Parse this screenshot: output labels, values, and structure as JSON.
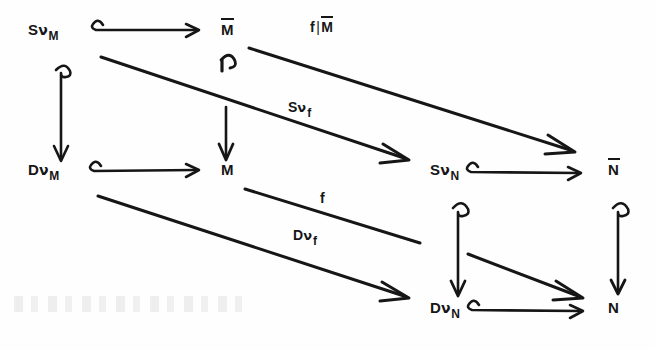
{
  "figure": {
    "kind": "commutative-diagram",
    "background_color": "#fefefe",
    "ink_color": "#161616"
  },
  "nodes": [
    {
      "id": "SvM",
      "text": "SνM",
      "base": "S",
      "nu": "ν",
      "sub": "M",
      "overbar": false,
      "x": 28,
      "y": 22
    },
    {
      "id": "Mbar",
      "text": "M̄",
      "base": "M",
      "nu": "",
      "sub": "",
      "overbar": true,
      "x": 221,
      "y": 22
    },
    {
      "id": "DvM",
      "text": "DνM",
      "base": "D",
      "nu": "ν",
      "sub": "M",
      "overbar": false,
      "x": 28,
      "y": 162
    },
    {
      "id": "M",
      "text": "M",
      "base": "M",
      "nu": "",
      "sub": "",
      "overbar": false,
      "x": 221,
      "y": 162
    },
    {
      "id": "SvN",
      "text": "SνN",
      "base": "S",
      "nu": "ν",
      "sub": "N",
      "overbar": false,
      "x": 430,
      "y": 162
    },
    {
      "id": "Nbar",
      "text": "N̄",
      "base": "N",
      "nu": "",
      "sub": "",
      "overbar": true,
      "x": 608,
      "y": 162
    },
    {
      "id": "DvN",
      "text": "DνN",
      "base": "D",
      "nu": "ν",
      "sub": "N",
      "overbar": false,
      "x": 430,
      "y": 300
    },
    {
      "id": "N",
      "text": "N",
      "base": "N",
      "nu": "",
      "sub": "",
      "overbar": false,
      "x": 608,
      "y": 300
    }
  ],
  "edge_labels": [
    {
      "id": "f-restricted-Mbar",
      "text": "f|M̄",
      "lead": "f",
      "bar": "|",
      "tail_base": "M",
      "tail_overbar": true,
      "tail_sub": "",
      "x": 310,
      "y": 20
    },
    {
      "id": "Sv-f",
      "text": "Sνf",
      "lead": "S",
      "nu": "ν",
      "sub": "f",
      "x": 288,
      "y": 100
    },
    {
      "id": "f",
      "text": "f",
      "lead": "f",
      "x": 320,
      "y": 191
    },
    {
      "id": "Dv-f",
      "text": "Dνf",
      "lead": "D",
      "nu": "ν",
      "sub": "f",
      "x": 293,
      "y": 228
    }
  ],
  "edges": [
    {
      "id": "SvM-to-Mbar",
      "from": "SvM",
      "to": "Mbar",
      "type": "hooked-horizontal",
      "label": ""
    },
    {
      "id": "SvM-to-DvM",
      "from": "SvM",
      "to": "DvM",
      "type": "hooked-vertical",
      "label": ""
    },
    {
      "id": "Mbar-to-M",
      "from": "Mbar",
      "to": "M",
      "type": "hooked-vertical",
      "label": ""
    },
    {
      "id": "DvM-to-M",
      "from": "DvM",
      "to": "M",
      "type": "hooked-horizontal",
      "label": ""
    },
    {
      "id": "Mbar-to-Nbar",
      "from": "Mbar",
      "to": "Nbar",
      "type": "diagonal",
      "label": "f|M̄"
    },
    {
      "id": "SvM-to-SvN",
      "from": "SvM",
      "to": "SvN",
      "type": "diagonal",
      "label": "Sνf"
    },
    {
      "id": "M-to-N",
      "from": "M",
      "to": "N",
      "type": "diagonal-clipped",
      "label": "f"
    },
    {
      "id": "DvM-to-DvN",
      "from": "DvM",
      "to": "DvN",
      "type": "diagonal",
      "label": "Dνf"
    },
    {
      "id": "SvN-to-Nbar",
      "from": "SvN",
      "to": "Nbar",
      "type": "hooked-horizontal",
      "label": ""
    },
    {
      "id": "SvN-to-DvN",
      "from": "SvN",
      "to": "DvN",
      "type": "hooked-vertical",
      "label": ""
    },
    {
      "id": "Nbar-to-N",
      "from": "Nbar",
      "to": "N",
      "type": "hooked-vertical",
      "label": ""
    },
    {
      "id": "DvN-to-N",
      "from": "DvN",
      "to": "N",
      "type": "hooked-horizontal",
      "label": ""
    }
  ]
}
